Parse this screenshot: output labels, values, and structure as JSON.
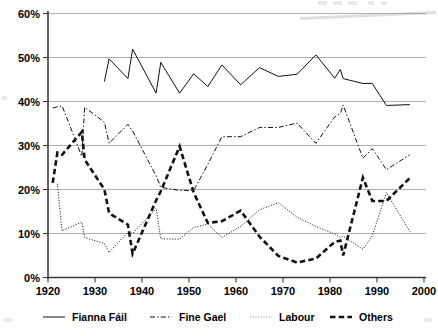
{
  "chart_data": {
    "type": "line",
    "title": "",
    "subtitle": "",
    "xlabel": "",
    "ylabel": "",
    "xlim": [
      1920,
      2000
    ],
    "ylim": [
      0,
      60
    ],
    "grid": true,
    "legend_position": "bottom",
    "y_tick_labels": [
      "0%",
      "10%",
      "20%",
      "30%",
      "40%",
      "50%",
      "60%"
    ],
    "y_ticks": [
      0,
      10,
      20,
      30,
      40,
      50,
      60
    ],
    "x_tick_labels": [
      "1920",
      "1930",
      "1940",
      "1950",
      "1960",
      "1970",
      "1980",
      "1990",
      "2000"
    ],
    "x_ticks": [
      1920,
      1930,
      1940,
      1950,
      1960,
      1970,
      1980,
      1990,
      2000
    ],
    "series": [
      {
        "name": "Fianna Fáil",
        "style": "solid",
        "color": "#111111",
        "x": [
          1932,
          1933,
          1937,
          1938,
          1943,
          1944,
          1948,
          1951,
          1954,
          1957,
          1961,
          1965,
          1969,
          1973,
          1977,
          1981,
          1982.2,
          1982.8,
          1987,
          1989,
          1992,
          1997
        ],
        "values": [
          44.5,
          49.7,
          45.2,
          51.9,
          41.9,
          48.9,
          41.9,
          46.3,
          43.4,
          48.3,
          43.8,
          47.7,
          45.7,
          46.2,
          50.6,
          45.3,
          47.3,
          45.2,
          44.1,
          44.1,
          39.1,
          39.3
        ]
      },
      {
        "name": "Fine Gael",
        "style": "dashdot",
        "color": "#111111",
        "x": [
          1921,
          1922,
          1923,
          1927.2,
          1927.8,
          1932,
          1933,
          1937,
          1938,
          1943,
          1944,
          1948,
          1951,
          1954,
          1957,
          1961,
          1965,
          1969,
          1973,
          1977,
          1981,
          1982.2,
          1982.8,
          1987,
          1989,
          1992,
          1997
        ],
        "values": [
          38.5,
          38.8,
          39.0,
          27.5,
          38.7,
          35.3,
          30.5,
          34.8,
          33.3,
          23.1,
          20.5,
          19.8,
          19.8,
          25.7,
          32.0,
          32.0,
          34.1,
          34.1,
          35.1,
          30.5,
          36.5,
          37.3,
          39.2,
          27.1,
          29.3,
          24.5,
          27.9
        ]
      },
      {
        "name": "Labour",
        "style": "dotted",
        "color": "#8a8a8a",
        "x": [
          1922,
          1923,
          1927.2,
          1927.8,
          1932,
          1933,
          1937,
          1938,
          1943,
          1944,
          1948,
          1951,
          1954,
          1957,
          1961,
          1965,
          1969,
          1973,
          1977,
          1981,
          1982.2,
          1982.8,
          1987,
          1989,
          1992,
          1997
        ],
        "values": [
          21.3,
          10.6,
          12.6,
          9.1,
          7.7,
          5.7,
          10.3,
          10.0,
          15.7,
          8.8,
          8.7,
          11.4,
          12.1,
          9.1,
          11.6,
          15.4,
          17.0,
          13.7,
          11.6,
          9.9,
          9.1,
          9.4,
          6.4,
          9.5,
          19.3,
          10.4
        ]
      },
      {
        "name": "Others",
        "style": "dashed",
        "color": "#111111",
        "x": [
          1921,
          1922,
          1923,
          1927.2,
          1927.8,
          1932,
          1933,
          1937,
          1938,
          1943,
          1944,
          1948,
          1951,
          1954,
          1957,
          1961,
          1965,
          1969,
          1973,
          1977,
          1981,
          1982.2,
          1982.8,
          1987,
          1989,
          1992,
          1997
        ],
        "values": [
          21.5,
          28.4,
          27.9,
          33.1,
          26.8,
          20.0,
          14.6,
          12.0,
          5.4,
          17.5,
          19.6,
          29.8,
          19.3,
          12.4,
          12.8,
          15.2,
          9.3,
          4.9,
          3.4,
          4.3,
          8.1,
          8.4,
          5.0,
          22.7,
          17.4,
          17.4,
          22.6
        ]
      }
    ]
  },
  "legend": {
    "items": [
      {
        "label": "Fianna Fáil",
        "style": "solid"
      },
      {
        "label": "Fine Gael",
        "style": "dashdot"
      },
      {
        "label": "Labour",
        "style": "dotted"
      },
      {
        "label": "Others",
        "style": "dashed"
      }
    ]
  }
}
